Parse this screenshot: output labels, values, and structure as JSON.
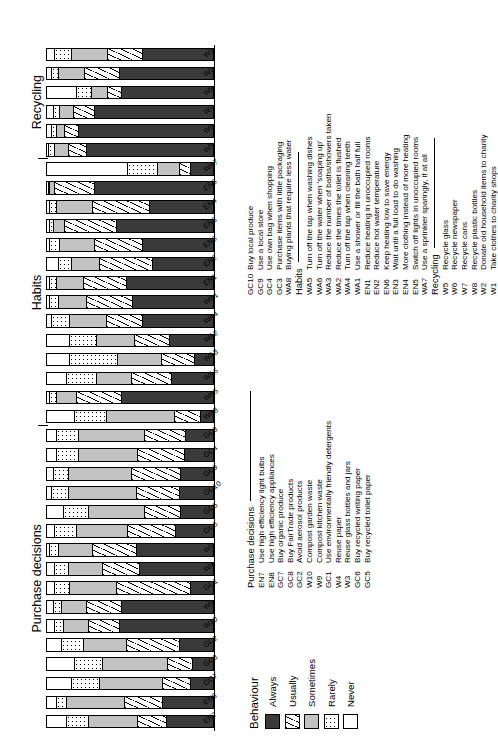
{
  "chart_data": {
    "type": "bar",
    "subtype": "stacked-horizontal-100-percent",
    "title": "",
    "xlabel": "",
    "ylabel": "",
    "ylim": [
      0,
      100
    ],
    "grid": false,
    "legend_position": "below-left",
    "legend_title": "Behaviour",
    "series": [
      {
        "name": "Always",
        "color": "#3a3a3a",
        "pattern": "solid-dark"
      },
      {
        "name": "Usually",
        "color": "#ffffff",
        "pattern": "diagonal-hatch"
      },
      {
        "name": "Sometimes",
        "color": "#c2c2c2",
        "pattern": "solid-light-grey"
      },
      {
        "name": "Rarely",
        "color": "#ffffff",
        "pattern": "dotted"
      },
      {
        "name": "Never",
        "color": "#ffffff",
        "pattern": "blank"
      }
    ],
    "categories": [
      "EN7",
      "EN8",
      "GC7",
      "GC8",
      "GC2",
      "W10",
      "W9",
      "GC1",
      "W4",
      "W3",
      "GC6",
      "GC5",
      "GC10",
      "GC9",
      "GC4",
      "GC3",
      "WA8",
      "WA5",
      "WA6",
      "WA3",
      "WA2",
      "WA4",
      "WA1",
      "EN1",
      "EN2",
      "EN6",
      "EN3",
      "EN4",
      "EN5",
      "WA7",
      "W5",
      "W6",
      "W7",
      "W8",
      "W2",
      "W1"
    ],
    "values": [
      {
        "category": "EN7",
        "Always": 28,
        "Usually": 17,
        "Sometimes": 30,
        "Rarely": 13,
        "Never": 12
      },
      {
        "category": "EN8",
        "Always": 30,
        "Usually": 23,
        "Sometimes": 35,
        "Rarely": 6,
        "Never": 6
      },
      {
        "category": "GC7",
        "Always": 13,
        "Usually": 17,
        "Sometimes": 38,
        "Rarely": 17,
        "Never": 15
      },
      {
        "category": "GC8",
        "Always": 12,
        "Usually": 15,
        "Sometimes": 39,
        "Rarely": 17,
        "Never": 17
      },
      {
        "category": "GC2",
        "Always": 20,
        "Usually": 32,
        "Sometimes": 26,
        "Rarely": 13,
        "Never": 9
      },
      {
        "category": "W10",
        "Always": 56,
        "Usually": 19,
        "Sometimes": 15,
        "Rarely": 5,
        "Never": 5
      },
      {
        "category": "W9",
        "Always": 55,
        "Usually": 21,
        "Sometimes": 15,
        "Rarely": 5,
        "Never": 4
      },
      {
        "category": "GC1",
        "Always": 13,
        "Usually": 45,
        "Sometimes": 28,
        "Rarely": 9,
        "Never": 5
      },
      {
        "category": "W4",
        "Always": 44,
        "Usually": 22,
        "Sometimes": 21,
        "Rarely": 8,
        "Never": 5
      },
      {
        "category": "W3",
        "Always": 46,
        "Usually": 26,
        "Sometimes": 21,
        "Rarely": 5,
        "Never": 2
      },
      {
        "category": "GC6",
        "Always": 22,
        "Usually": 29,
        "Sometimes": 31,
        "Rarely": 13,
        "Never": 5
      },
      {
        "category": "GC5",
        "Always": 19,
        "Usually": 22,
        "Sometimes": 34,
        "Rarely": 15,
        "Never": 10
      },
      {
        "category": "GC10",
        "Always": 20,
        "Usually": 26,
        "Sometimes": 41,
        "Rarely": 10,
        "Never": 3
      },
      {
        "category": "GC9",
        "Always": 19,
        "Usually": 30,
        "Sometimes": 38,
        "Rarely": 9,
        "Never": 4
      },
      {
        "category": "GC4",
        "Always": 17,
        "Usually": 28,
        "Sometimes": 36,
        "Rarely": 13,
        "Never": 6
      },
      {
        "category": "GC3",
        "Always": 16,
        "Usually": 25,
        "Sometimes": 40,
        "Rarely": 13,
        "Never": 6
      },
      {
        "category": "WA8",
        "Always": 7,
        "Usually": 16,
        "Sometimes": 41,
        "Rarely": 19,
        "Never": 17
      },
      {
        "category": "WA5",
        "Always": 55,
        "Usually": 27,
        "Sometimes": 12,
        "Rarely": 4,
        "Never": 2
      },
      {
        "category": "WA6",
        "Always": 25,
        "Usually": 24,
        "Sometimes": 21,
        "Rarely": 18,
        "Never": 12
      },
      {
        "category": "WA3",
        "Always": 11,
        "Usually": 20,
        "Sometimes": 26,
        "Rarely": 29,
        "Never": 14
      },
      {
        "category": "WA2",
        "Always": 26,
        "Usually": 21,
        "Sometimes": 23,
        "Rarely": 16,
        "Never": 14
      },
      {
        "category": "WA4",
        "Always": 42,
        "Usually": 22,
        "Sometimes": 22,
        "Rarely": 11,
        "Never": 3
      },
      {
        "category": "WA1",
        "Always": 48,
        "Usually": 28,
        "Sometimes": 17,
        "Rarely": 5,
        "Never": 2
      },
      {
        "category": "EN1",
        "Always": 52,
        "Usually": 26,
        "Sometimes": 16,
        "Rarely": 4,
        "Never": 2
      },
      {
        "category": "EN2",
        "Always": 36,
        "Usually": 32,
        "Sometimes": 17,
        "Rarely": 8,
        "Never": 7
      },
      {
        "category": "EN6",
        "Always": 42,
        "Usually": 29,
        "Sometimes": 21,
        "Rarely": 6,
        "Never": 2
      },
      {
        "category": "EN3",
        "Always": 58,
        "Usually": 31,
        "Sometimes": 7,
        "Rarely": 2,
        "Never": 2
      },
      {
        "category": "EN4",
        "Always": 38,
        "Usually": 34,
        "Sometimes": 22,
        "Rarely": 4,
        "Never": 2
      },
      {
        "category": "EN5",
        "Always": 71,
        "Usually": 24,
        "Sometimes": 3,
        "Rarely": 1,
        "Never": 1
      },
      {
        "category": "WA7",
        "Always": 13,
        "Usually": 7,
        "Sometimes": 13,
        "Rarely": 18,
        "Never": 49
      },
      {
        "category": "W5",
        "Always": 76,
        "Usually": 11,
        "Sometimes": 8,
        "Rarely": 4,
        "Never": 1
      },
      {
        "category": "W6",
        "Always": 81,
        "Usually": 8,
        "Sometimes": 5,
        "Rarely": 3,
        "Never": 3
      },
      {
        "category": "W7",
        "Always": 71,
        "Usually": 13,
        "Sometimes": 8,
        "Rarely": 4,
        "Never": 4
      },
      {
        "category": "W8",
        "Always": 55,
        "Usually": 8,
        "Sometimes": 10,
        "Rarely": 9,
        "Never": 18
      },
      {
        "category": "W2",
        "Always": 56,
        "Usually": 21,
        "Sometimes": 16,
        "Rarely": 4,
        "Never": 3
      },
      {
        "category": "W1",
        "Always": 42,
        "Usually": 21,
        "Sometimes": 22,
        "Rarely": 10,
        "Never": 5
      }
    ],
    "groups": [
      {
        "label": "Purchase decisions",
        "start": "EN7",
        "end": "GC3"
      },
      {
        "label": "Habits",
        "start": "WA8",
        "end": "WA7"
      },
      {
        "label": "Recycling",
        "start": "W5",
        "end": "W1"
      }
    ]
  },
  "legend": {
    "title": "Behaviour",
    "items": [
      {
        "label": "Always"
      },
      {
        "label": "Usually"
      },
      {
        "label": "Sometimes"
      },
      {
        "label": "Rarely"
      },
      {
        "label": "Never"
      }
    ]
  },
  "keys": {
    "purchase": {
      "heading": "Purchase decisions",
      "rows": [
        {
          "code": "EN7",
          "desc": "Use high efficiency light bulbs"
        },
        {
          "code": "EN8",
          "desc": "Use high efficiency appliances"
        },
        {
          "code": "GC7",
          "desc": "Buy organic produce"
        },
        {
          "code": "GC8",
          "desc": "Buy FairTrade products"
        },
        {
          "code": "GC2",
          "desc": "Avoid aerosol products"
        },
        {
          "code": "W10",
          "desc": "Compost garden waste"
        },
        {
          "code": "W9",
          "desc": "Compost kitchen waste"
        },
        {
          "code": "GC1",
          "desc": "Use environmentally friendly detergents"
        },
        {
          "code": "W4",
          "desc": "Reuse paper"
        },
        {
          "code": "W3",
          "desc": "Reuse glass bottles and jars"
        },
        {
          "code": "GC6",
          "desc": "Buy recycled writing paper"
        },
        {
          "code": "GC5",
          "desc": "Buy recycled toilet paper"
        },
        {
          "code": "GC10",
          "desc": "Buy local produce"
        },
        {
          "code": "GC9",
          "desc": "Use a local store"
        },
        {
          "code": "GC4",
          "desc": "Use own bag when shopping"
        },
        {
          "code": "GC3",
          "desc": "Purchase items with little packaging"
        },
        {
          "code": "WA8",
          "desc": "Buying plants that require less water"
        }
      ]
    },
    "habits": {
      "heading": "Habits",
      "rows": [
        {
          "code": "WA5",
          "desc": "Turn off the tap when washing dishes"
        },
        {
          "code": "WA6",
          "desc": "Turn off the water when 'soaping up'"
        },
        {
          "code": "WA3",
          "desc": "Reduce the number of baths/showers taken"
        },
        {
          "code": "WA2",
          "desc": "Reduce the times the toilet is flushed"
        },
        {
          "code": "WA4",
          "desc": "Turn off the tap when cleaning teeth"
        },
        {
          "code": "WA1",
          "desc": "Use a shower or fill the bath half full"
        },
        {
          "code": "EN1",
          "desc": "Reduce heating in unoccupied rooms"
        },
        {
          "code": "EN2",
          "desc": "Reduce hot water temperature"
        },
        {
          "code": "EN6",
          "desc": "Keep heating low to save energy"
        },
        {
          "code": "EN3",
          "desc": "Wait until a full load to do washing"
        },
        {
          "code": "EN4",
          "desc": "More clothing instead of more heating"
        },
        {
          "code": "EN5",
          "desc": "Switch off lights in unoccupied rooms"
        },
        {
          "code": "WA7",
          "desc": "Use a sprinkler sparingly, if at all"
        }
      ]
    },
    "recycling": {
      "heading": "Recycling",
      "rows": [
        {
          "code": "W5",
          "desc": "Recycle glass"
        },
        {
          "code": "W6",
          "desc": "Recycle newspaper"
        },
        {
          "code": "W7",
          "desc": "Recycle cans"
        },
        {
          "code": "W8",
          "desc": "Recycle plastic bottles"
        },
        {
          "code": "W2",
          "desc": "Donate old household items to charity"
        },
        {
          "code": "W1",
          "desc": "Take clothes to charity shops"
        }
      ]
    }
  }
}
